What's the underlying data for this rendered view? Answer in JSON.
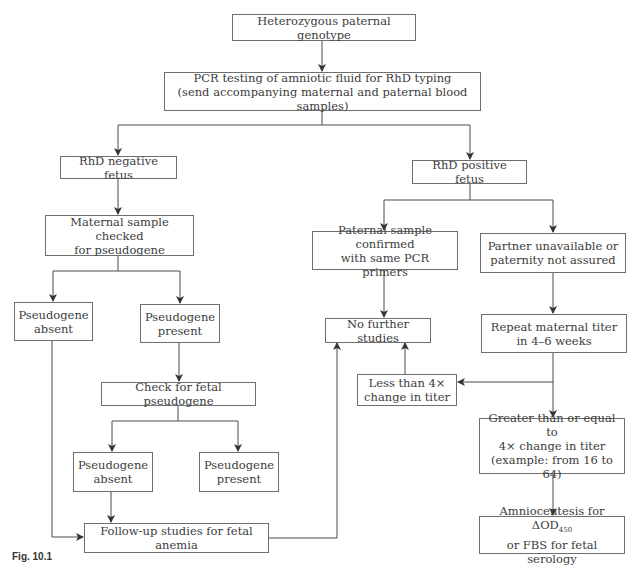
{
  "diagram": {
    "nodes": {
      "heterozygous": "Heterozygous paternal genotype",
      "pcr": "PCR testing of amniotic fluid for RhD typing\n(send accompanying maternal and paternal blood samples)",
      "rhd_negative": "RhD negative fetus",
      "rhd_positive": "RhD positive fetus",
      "maternal_checked": "Maternal sample checked\nfor pseudogene",
      "pseudogene_absent_1": "Pseudogene\nabsent",
      "pseudogene_present_1": "Pseudogene\npresent",
      "check_fetal": "Check for fetal pseudogene",
      "pseudogene_absent_2": "Pseudogene\nabsent",
      "pseudogene_present_2": "Pseudogene\npresent",
      "follow_up": "Follow-up studies for fetal anemia",
      "paternal_confirmed": "Paternal sample confirmed\nwith same PCR primers",
      "partner_unavailable": "Partner unavailable or\npaternity not assured",
      "no_further": "No further studies",
      "repeat_titer": "Repeat maternal titer\nin 4–6 weeks",
      "less_than_4x": "Less than 4×\nchange in titer",
      "greater_4x": "Greater than or equal to\n4× change in titer\n(example: from 16 to 64)",
      "amnio_line1": "Amniocentesis for ΔOD",
      "amnio_sub": "450",
      "amnio_line2": "or FBS for fetal serology"
    },
    "caption": {
      "label": "Fig. 10.1"
    },
    "colors": {
      "line": "#4a4a4a",
      "border": "#6e6e6e",
      "text": "#3c3c3c"
    }
  }
}
